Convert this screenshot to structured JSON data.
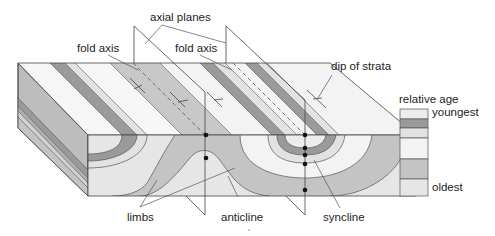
{
  "diagram": {
    "labels": {
      "axial_planes": "axial planes",
      "fold_axis_left": "fold axis",
      "fold_axis_right": "fold axis",
      "dip_of_strata": "dip of strata",
      "limbs": "limbs",
      "anticline": "anticline",
      "syncline": "syncline"
    },
    "legend": {
      "title": "relative age",
      "top_label": "youngest",
      "bottom_label": "oldest",
      "layers": [
        {
          "name": "layer-1-youngest",
          "color": "#ececec"
        },
        {
          "name": "layer-2",
          "color": "#9a9a9a"
        },
        {
          "name": "layer-3",
          "color": "#e2e2e2"
        },
        {
          "name": "layer-4",
          "color": "#f3f3f3"
        },
        {
          "name": "layer-5",
          "color": "#c4c4c4"
        },
        {
          "name": "layer-6-oldest",
          "color": "#e6e6e6"
        }
      ]
    },
    "colors": {
      "outline": "#444444",
      "leader": "#555555",
      "marker": "#111111"
    }
  }
}
